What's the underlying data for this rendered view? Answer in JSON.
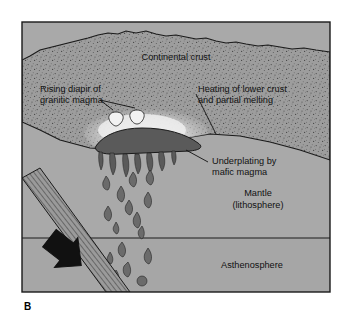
{
  "figure": {
    "caption": "B",
    "frame": {
      "x": 22,
      "y": 22,
      "width": 308,
      "height": 270
    }
  },
  "colors": {
    "background": "#ffffff",
    "crust_fill": "#9d9d9d",
    "crust_stipple": "#4a4a4a",
    "mantle_fill": "#a9a9a9",
    "asthenosphere_fill": "#a6a6a6",
    "melt_halo": "#e8e8e8",
    "mafic_body": "#5a5a5a",
    "magma_blob": "#6b6b6b",
    "diapir_white": "#f2f2f2",
    "slab_fill": "#9a9a9a",
    "slab_hatch": "#3c3c3c",
    "arrow": "#111111",
    "outline": "#1a1a1a",
    "text": "#111111"
  },
  "labels": {
    "continental_crust": "Continental crust",
    "rising_diapir_line1": "Rising diapir of",
    "rising_diapir_line2": "granitic magma",
    "heating_line1": "Heating of lower crust",
    "heating_line2": "and partial melting",
    "underplating_line1": "Underplating by",
    "underplating_line2": "mafic magma",
    "mantle_line1": "Mantle",
    "mantle_line2": "(lithosphere)",
    "asthenosphere": "Asthenosphere"
  },
  "diagram_elements": {
    "layers": [
      {
        "name": "continental-crust",
        "label": "Continental crust"
      },
      {
        "name": "mantle-lithosphere",
        "label": "Mantle (lithosphere)"
      },
      {
        "name": "asthenosphere",
        "label": "Asthenosphere"
      }
    ],
    "features": [
      {
        "name": "mafic-underplating-body",
        "label": "Underplating by mafic magma"
      },
      {
        "name": "partial-melt-halo",
        "label": "Heating of lower crust and partial melting"
      },
      {
        "name": "granitic-diapir",
        "label": "Rising diapir of granitic magma"
      },
      {
        "name": "subducting-slab",
        "label": ""
      },
      {
        "name": "subduction-arrow",
        "label": ""
      }
    ],
    "boundary_line_y": 238,
    "magma_blob_count": 16,
    "diapir_count": 2
  }
}
